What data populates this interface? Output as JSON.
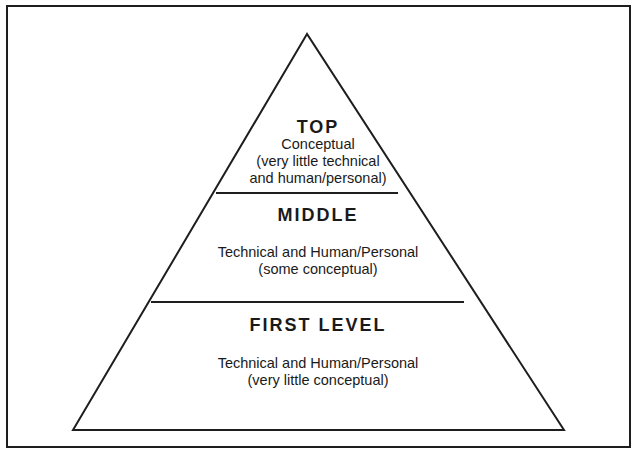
{
  "diagram": {
    "type": "pyramid",
    "levels": [
      {
        "title": "TOP",
        "description_lines": [
          "Conceptual",
          "(very little technical",
          "and human/personal)"
        ]
      },
      {
        "title": "MIDDLE",
        "description_lines": [
          "Technical and Human/Personal",
          "(some conceptual)"
        ]
      },
      {
        "title": "FIRST LEVEL",
        "description_lines": [
          "Technical and Human/Personal",
          "(very little conceptual)"
        ]
      }
    ],
    "colors": {
      "line": "#1e1e1e",
      "text": "#1a1a1a",
      "background": "#ffffff"
    }
  }
}
